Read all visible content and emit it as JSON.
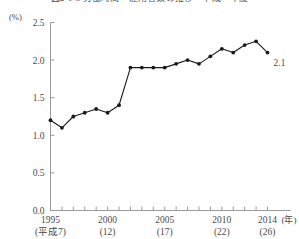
{
  "title": "図2-1-3 労働時間　雇用者数の推移　平成　年度",
  "chart_data": {
    "type": "line",
    "title": "図2-1-3 労働時間　雇用者数の推移　平成　年度",
    "unit_label": "(%)",
    "xlabel": "(年)",
    "ylabel": "",
    "ylim": [
      0.0,
      2.5
    ],
    "xlim": [
      1995,
      2014
    ],
    "grid": false,
    "legend": null,
    "yticks": [
      "0.0",
      "0.5",
      "1.0",
      "1.5",
      "2.0",
      "2.5"
    ],
    "ytick_values": [
      0.0,
      0.5,
      1.0,
      1.5,
      2.0,
      2.5
    ],
    "xticks": [
      {
        "year": 1995,
        "label": "1995",
        "sub": "(平成7)"
      },
      {
        "year": 2000,
        "label": "2000",
        "sub": "(12)"
      },
      {
        "year": 2005,
        "label": "2005",
        "sub": "(17)"
      },
      {
        "year": 2010,
        "label": "2010",
        "sub": "(22)"
      },
      {
        "year": 2014,
        "label": "2014",
        "sub": "(26)"
      }
    ],
    "x": [
      1995,
      1996,
      1997,
      1998,
      1999,
      2000,
      2001,
      2002,
      2003,
      2004,
      2005,
      2006,
      2007,
      2008,
      2009,
      2010,
      2011,
      2012,
      2013,
      2014
    ],
    "values": [
      1.2,
      1.1,
      1.25,
      1.3,
      1.35,
      1.3,
      1.4,
      1.9,
      1.9,
      1.9,
      1.9,
      1.95,
      2.0,
      1.95,
      2.05,
      2.15,
      2.1,
      2.2,
      2.25,
      2.1
    ],
    "series": [
      {
        "name": "割合",
        "values": [
          1.2,
          1.1,
          1.25,
          1.3,
          1.35,
          1.3,
          1.4,
          1.9,
          1.9,
          1.9,
          1.9,
          1.95,
          2.0,
          1.95,
          2.05,
          2.15,
          2.1,
          2.2,
          2.25,
          2.1
        ]
      }
    ],
    "annotations": [
      {
        "text": "2.1",
        "x": 2014,
        "y": 2.1
      }
    ],
    "line_color": "#1a1a1a",
    "marker_color": "#1a1a1a",
    "axis_color": "#9a9a9a"
  }
}
